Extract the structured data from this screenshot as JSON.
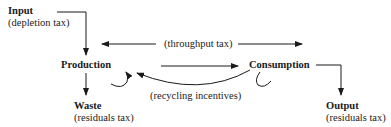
{
  "nodes": {
    "input": {
      "title": "Input",
      "tax": "(depletion tax)"
    },
    "production": {
      "title": "Production"
    },
    "consumption": {
      "title": "Consumption"
    },
    "waste": {
      "title": "Waste",
      "tax": "(residuals tax)"
    },
    "output": {
      "title": "Output",
      "tax": "(residuals tax)"
    }
  },
  "edges": {
    "throughput": {
      "label": "(throughput tax)"
    },
    "recycling": {
      "label": "(recycling incentives)"
    }
  }
}
